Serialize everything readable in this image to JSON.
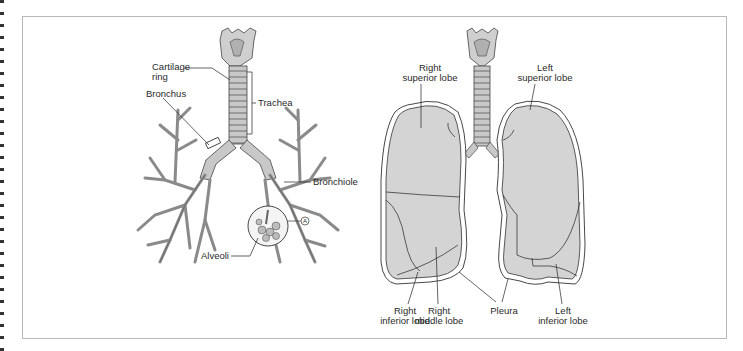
{
  "figure": {
    "left_panel": {
      "title": "Airways",
      "labels": {
        "cartilage_ring_1": "Cartilage",
        "cartilage_ring_2": "ring",
        "bronchus": "Bronchus",
        "trachea": "Trachea",
        "bronchiole": "Bronchiole",
        "alveoli": "Alveoli",
        "marker": "A"
      }
    },
    "right_panel": {
      "title": "Lungs",
      "labels": {
        "right_superior_1": "Right",
        "right_superior_2": "superior lobe",
        "left_superior_1": "Left",
        "left_superior_2": "superior lobe",
        "right_inferior_1": "Right",
        "right_inferior_2": "inferior lobe",
        "right_middle_1": "Right",
        "right_middle_2": "middle lobe",
        "pleura": "Pleura",
        "left_inferior_1": "Left",
        "left_inferior_2": "inferior lobe"
      }
    },
    "colors": {
      "lung_fill": "#d4d4d4",
      "airway_fill": "#bdbdbd",
      "outline": "#333333",
      "frame_border": "#b9b9b9"
    }
  }
}
